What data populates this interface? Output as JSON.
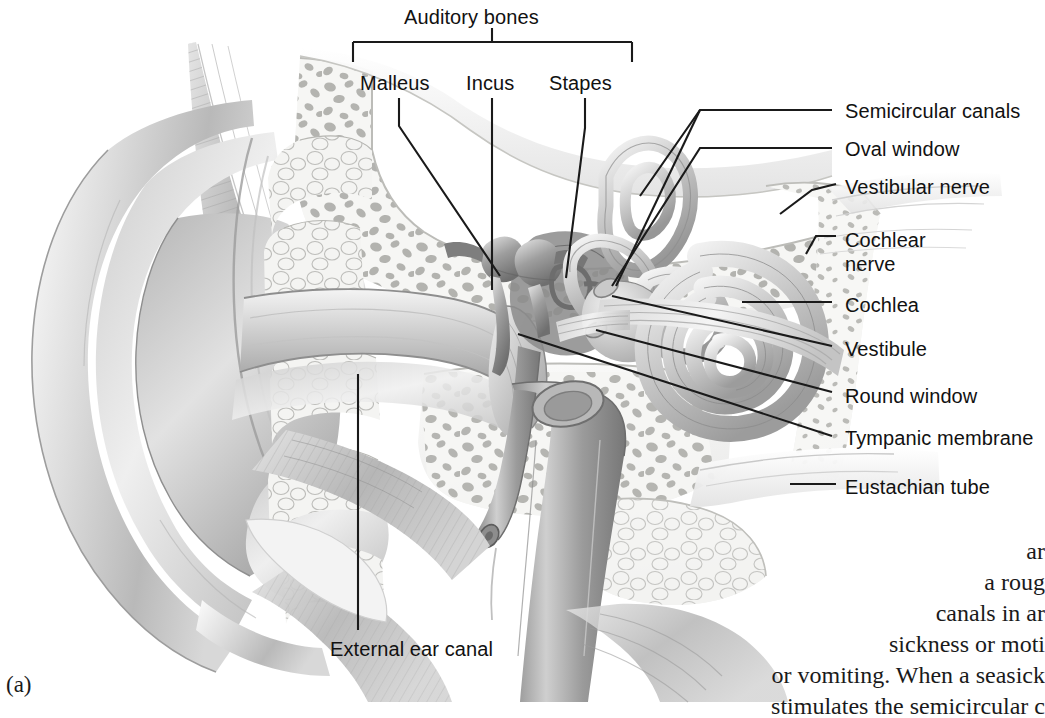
{
  "figure": {
    "number": "(a)"
  },
  "bracket": {
    "label": "Auditory bones"
  },
  "top_labels": [
    {
      "name": "malleus",
      "text": "Malleus",
      "x": 360,
      "y": 72
    },
    {
      "name": "incus",
      "text": "Incus",
      "x": 466,
      "y": 72
    },
    {
      "name": "stapes",
      "text": "Stapes",
      "x": 549,
      "y": 72
    }
  ],
  "right_labels": [
    {
      "name": "semicircular-canals",
      "text": "Semicircular canals",
      "x": 845,
      "y": 100
    },
    {
      "name": "oval-window",
      "text": "Oval window",
      "x": 845,
      "y": 138
    },
    {
      "name": "vestibular-nerve",
      "text": "Vestibular nerve",
      "x": 845,
      "y": 176
    },
    {
      "name": "cochlear-nerve",
      "text": "Cochlear\nnerve",
      "x": 845,
      "y": 228
    },
    {
      "name": "cochlea",
      "text": "Cochlea",
      "x": 845,
      "y": 294
    },
    {
      "name": "vestibule",
      "text": "Vestibule",
      "x": 845,
      "y": 338
    },
    {
      "name": "round-window",
      "text": "Round window",
      "x": 845,
      "y": 385
    },
    {
      "name": "tympanic-membrane",
      "text": "Tympanic membrane",
      "x": 845,
      "y": 427
    },
    {
      "name": "eustachian-tube",
      "text": "Eustachian tube",
      "x": 845,
      "y": 476
    }
  ],
  "bottom_labels": [
    {
      "name": "external-ear-canal",
      "text": "External ear canal",
      "x": 330,
      "y": 640
    }
  ],
  "body_text": {
    "lines": [
      "ar",
      "a roug",
      "canals in ar",
      "sickness or moti",
      "or vomiting. When a seasick",
      "stimulates the semicircular c"
    ]
  },
  "colors": {
    "background": "#ffffff",
    "ink": "#111111",
    "leader_line": "#1a1a1a",
    "cartilage_light": "#e9e9e9",
    "cartilage_mid": "#c9c9c9",
    "cartilage_dark": "#9a9a9a",
    "bone_fill": "#f2f2f0",
    "bone_trabecula": "#b4b4b0",
    "muscle": "#bdbdbd",
    "tube": "#a8a8a8"
  }
}
